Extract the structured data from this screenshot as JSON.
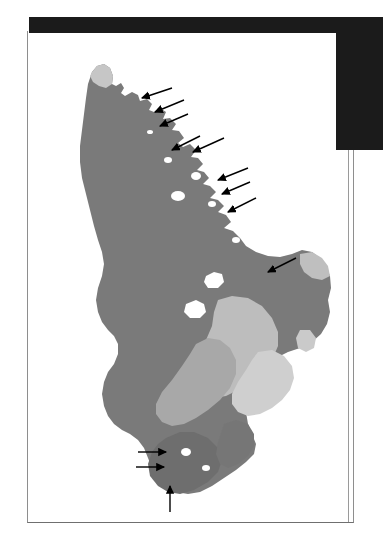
{
  "figure": {
    "caption": "",
    "panel_background": "#ffffff",
    "scan_edge_color": "#1b1b1b",
    "border_color": "#8e8e8e"
  },
  "map": {
    "name": "north-island-new-zealand",
    "landmass_label": "North Island",
    "legend_visible": false,
    "regions": [
      {
        "id": "region-main-dark",
        "label": "Main shaded region",
        "color": "#7a7a7a",
        "tone": "dark-gray"
      },
      {
        "id": "region-central-light",
        "label": "Central light region",
        "color": "#bdbdbd",
        "tone": "light-gray"
      },
      {
        "id": "region-central-mid",
        "label": "Central mid region",
        "color": "#a8a8a8",
        "tone": "mid-gray"
      },
      {
        "id": "region-south-east",
        "label": "South-east pale region",
        "color": "#cfcfcf",
        "tone": "pale-gray"
      },
      {
        "id": "region-north-tip",
        "label": "Northern tip pale region",
        "color": "#c6c6c6",
        "tone": "pale-gray"
      },
      {
        "id": "region-east-cape",
        "label": "East cape pale region",
        "color": "#bfbfbf",
        "tone": "pale-gray"
      },
      {
        "id": "region-south-lobe",
        "label": "Southern dark lobe",
        "color": "#6e6e6e",
        "tone": "dark-gray"
      }
    ]
  },
  "annotations": {
    "arrow_color": "#000000",
    "arrow_count": 12,
    "arrows": [
      {
        "id": "arrow-nw-coast-1",
        "label": "Arrow 1 — north-east coast",
        "direction": "down-left"
      },
      {
        "id": "arrow-nw-coast-2",
        "label": "Arrow 2 — north-east coast",
        "direction": "down-left"
      },
      {
        "id": "arrow-nw-coast-3",
        "label": "Arrow 3 — north-east coast",
        "direction": "down-left"
      },
      {
        "id": "arrow-ne-coast-4",
        "label": "Arrow 4 — north-east coast",
        "direction": "down-left"
      },
      {
        "id": "arrow-ne-coast-5",
        "label": "Arrow 5 — north-east coast",
        "direction": "down-left"
      },
      {
        "id": "arrow-ne-coast-6",
        "label": "Arrow 6 — north-east coast",
        "direction": "down-left"
      },
      {
        "id": "arrow-ne-coast-7",
        "label": "Arrow 7 — north-east coast",
        "direction": "down-left"
      },
      {
        "id": "arrow-ne-coast-8",
        "label": "Arrow 8 — north-east coast",
        "direction": "down-left"
      },
      {
        "id": "arrow-bay-9",
        "label": "Arrow 9 — eastern bay",
        "direction": "down-left"
      },
      {
        "id": "arrow-south-10",
        "label": "Arrow 10 — southern coast",
        "direction": "right"
      },
      {
        "id": "arrow-south-11",
        "label": "Arrow 11 — southern coast",
        "direction": "right"
      },
      {
        "id": "arrow-south-12",
        "label": "Arrow 12 — southern tip",
        "direction": "up"
      }
    ]
  }
}
